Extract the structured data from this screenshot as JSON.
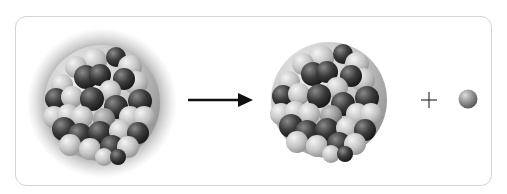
{
  "diagram": {
    "elements": [
      {
        "id": "parent-nucleus",
        "label": "Excited parent nucleus (glowing halo)"
      },
      {
        "id": "reaction-arrow",
        "label": "arrow"
      },
      {
        "id": "daughter-nucleus",
        "label": "Daughter nucleus"
      },
      {
        "id": "plus-sign",
        "label": "+"
      },
      {
        "id": "emitted-particle",
        "label": "Emitted particle"
      }
    ],
    "plus_symbol": "+",
    "colors": {
      "frame": "#d4d4d4",
      "dark_nucleon": "#3a3a3a",
      "light_nucleon": "#c8c8c8",
      "halo": "#9a9a9a",
      "arrow": "#111111"
    }
  }
}
